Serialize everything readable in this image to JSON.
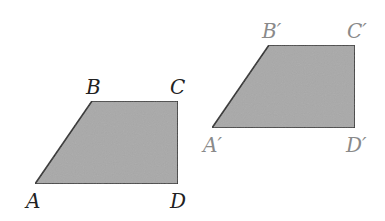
{
  "diagram": {
    "fill_color": "#a9a9a9",
    "stroke_color": "#2b2b2b",
    "original": {
      "labels": {
        "A": "A",
        "B": "B",
        "C": "C",
        "D": "D"
      },
      "label_color": "#222222",
      "vertices": {
        "A": [
          35,
          184
        ],
        "B": [
          92,
          101
        ],
        "C": [
          178,
          101
        ],
        "D": [
          178,
          184
        ]
      }
    },
    "image": {
      "labels": {
        "A": "A′",
        "B": "B′",
        "C": "C′",
        "D": "D′"
      },
      "label_color": "#8a8a8a",
      "vertices": {
        "A": [
          212,
          128
        ],
        "B": [
          269,
          45
        ],
        "C": [
          355,
          45
        ],
        "D": [
          355,
          128
        ]
      }
    }
  }
}
